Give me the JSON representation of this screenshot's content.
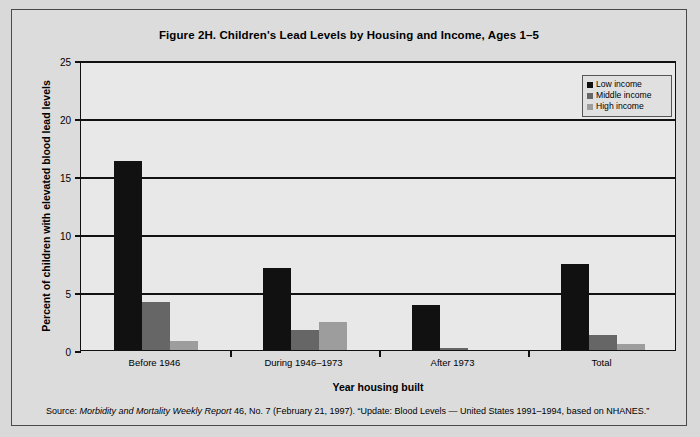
{
  "chart_data": {
    "type": "bar",
    "title": "Figure 2H. Children's Lead Levels by Housing and Income, Ages 1–5",
    "xlabel": "Year housing built",
    "ylabel": "Percent of children with elevated blood lead levels",
    "categories": [
      "Before 1946",
      "During 1946–1973",
      "After 1973",
      "Total"
    ],
    "series": [
      {
        "name": "Low income",
        "color": "#111111",
        "values": [
          16.3,
          7.1,
          3.9,
          7.4
        ]
      },
      {
        "name": "Middle income",
        "color": "#666666",
        "values": [
          4.1,
          1.7,
          0.2,
          1.3
        ]
      },
      {
        "name": "High income",
        "color": "#9d9d9d",
        "values": [
          0.8,
          2.4,
          0.0,
          0.5
        ]
      }
    ],
    "ylim": [
      0,
      25
    ],
    "yticks": [
      0,
      5,
      10,
      15,
      20,
      25
    ],
    "ytick_labels": [
      "0",
      "5",
      "10",
      "15",
      "20",
      "25"
    ],
    "grid": true,
    "legend_position": "top-right"
  },
  "source": {
    "prefix": "Source: ",
    "italic": "Morbidity and Mortality Weekly Report",
    "suffix": " 46, No. 7 (February 21, 1997).  “Update: Blood Levels — United States 1991–1994, based on NHANES.”"
  }
}
